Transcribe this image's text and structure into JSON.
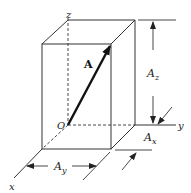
{
  "diagram": {
    "type": "vector-components-box",
    "labels": {
      "z_axis": "z",
      "y_axis": "y",
      "x_axis": "x",
      "origin": "O",
      "vector": "A",
      "component_z": "A",
      "component_z_sub": "z",
      "component_x": "A",
      "component_x_sub": "x",
      "component_y": "A",
      "component_y_sub": "y"
    },
    "colors": {
      "line": "#333333",
      "vector": "#111111",
      "background": "#ffffff"
    }
  }
}
